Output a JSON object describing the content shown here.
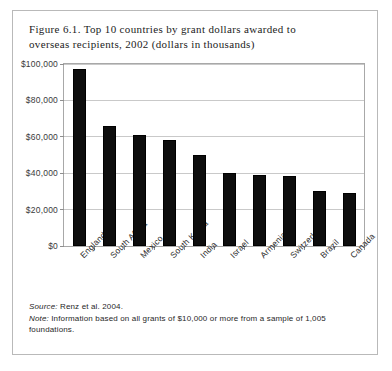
{
  "figure": {
    "title_line1": "Figure 6.1. Top 10 countries by grant dollars awarded to",
    "title_line2": "overseas recipients, 2002 (dollars in thousands)",
    "source_label": "Source:",
    "source_text": " Renz et al. 2004.",
    "note_label": "Note:",
    "note_text": " Information based on all grants of $10,000 or more from a sample of 1,005 foundations.",
    "border_color": "#b9b9b9"
  },
  "chart_data": {
    "type": "bar",
    "title": "Figure 6.1. Top 10 countries by grant dollars awarded to overseas recipients, 2002 (dollars in thousands)",
    "xlabel": "",
    "ylabel": "",
    "categories": [
      "England",
      "South Africa",
      "Mexico",
      "South Korea",
      "India",
      "Israel",
      "Armenia",
      "Switzerland",
      "Brazil",
      "Canada"
    ],
    "values": [
      97000,
      66000,
      61000,
      58000,
      50000,
      40000,
      39000,
      38500,
      30000,
      29000
    ],
    "ylim": [
      0,
      100000
    ],
    "ytick_values": [
      0,
      20000,
      40000,
      60000,
      80000,
      100000
    ],
    "ytick_labels": [
      "$0",
      "$20,000",
      "$40,000",
      "$60,000",
      "$80,000",
      "$100,000"
    ],
    "grid": true,
    "legend": false,
    "bar_color": "#0d0d0d"
  }
}
